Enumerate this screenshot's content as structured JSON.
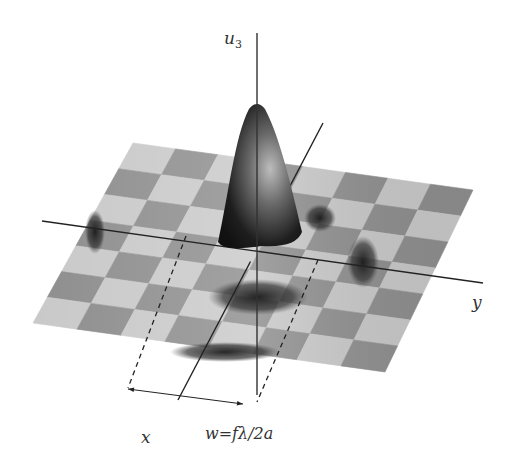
{
  "figure": {
    "kind": "3D surface plot (diffraction pattern over checkerboard plane)",
    "colors": {
      "background": "#ffffff",
      "check_light": "#c9c9c9",
      "check_dark": "#8e8e8e",
      "peak_dark": "#1e1e1e",
      "axis_line": "#222222"
    },
    "surface": {
      "corners": {
        "back_left": [
          133,
          143
        ],
        "back_right": [
          473,
          190
        ],
        "front_right": [
          385,
          372
        ],
        "front_left": [
          33,
          323
        ]
      },
      "grid_cols": 8,
      "grid_rows": 7
    },
    "peak": {
      "apex": [
        257,
        105
      ],
      "base_center": [
        262,
        238
      ],
      "base_halfwidth": 38
    },
    "dips": [
      {
        "center": [
          320,
          218
        ],
        "rx": 16,
        "ry": 14
      },
      {
        "center": [
          363,
          262
        ],
        "rx": 16,
        "ry": 26
      },
      {
        "center": [
          258,
          297
        ],
        "rx": 50,
        "ry": 18
      },
      {
        "center": [
          225,
          352
        ],
        "rx": 55,
        "ry": 10
      },
      {
        "center": [
          95,
          232
        ],
        "rx": 10,
        "ry": 22
      }
    ],
    "axes": {
      "u3": {
        "from": [
          257,
          395
        ],
        "to": [
          257,
          33
        ],
        "label": "u",
        "label_sub": "3",
        "label_pos": [
          224,
          28
        ]
      },
      "y": {
        "from": [
          42,
          221
        ],
        "to": [
          483,
          283
        ],
        "label": "y",
        "label_pos": [
          472,
          292
        ]
      },
      "x": {
        "from": [
          323,
          123
        ],
        "to": [
          178,
          400
        ],
        "label": "x",
        "label_pos": [
          141,
          427
        ]
      }
    },
    "width_marker": {
      "dashed_left": [
        [
          186,
          236
        ],
        [
          128,
          388
        ]
      ],
      "dashed_right": [
        [
          318,
          260
        ],
        [
          257,
          402
        ]
      ],
      "arrow": {
        "from": [
          128,
          389
        ],
        "to": [
          243,
          404
        ]
      },
      "label": "w=fλ/2a",
      "label_pos": [
        205,
        424
      ]
    }
  }
}
